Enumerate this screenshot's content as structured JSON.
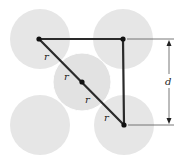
{
  "diagram": {
    "type": "geometry",
    "colors": {
      "background": "#ffffff",
      "circle_fill": "#e6e6e6",
      "line": "#2a2a2a",
      "dimension_line": "#555555"
    },
    "circles": [
      {
        "id": "top-left",
        "cx": 40,
        "cy": 39,
        "r": 30
      },
      {
        "id": "top-right",
        "cx": 123,
        "cy": 39,
        "r": 30
      },
      {
        "id": "bottom-left",
        "cx": 40,
        "cy": 125,
        "r": 30
      },
      {
        "id": "bottom-right",
        "cx": 124,
        "cy": 125,
        "r": 30
      },
      {
        "id": "center",
        "cx": 82,
        "cy": 82,
        "r": 29
      }
    ],
    "points": [
      {
        "id": "p-top-left",
        "x": 39,
        "y": 39
      },
      {
        "id": "p-top-right",
        "x": 123,
        "y": 39
      },
      {
        "id": "p-center",
        "x": 82,
        "y": 82
      },
      {
        "id": "p-bottom-right",
        "x": 124,
        "y": 125
      }
    ],
    "labels": {
      "r1": "r",
      "r2": "r",
      "r3": "r",
      "r4": "r",
      "dimension": "d"
    }
  }
}
